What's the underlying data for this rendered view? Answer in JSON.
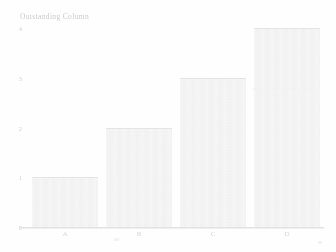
{
  "chart_data": {
    "type": "bar",
    "title": "Outstanding Column",
    "xlabel": "",
    "ylabel": "",
    "categories": [
      "A",
      "B",
      "C",
      "D"
    ],
    "values": [
      1,
      2,
      3,
      4
    ],
    "series": [
      {
        "name": "Series 1",
        "values": [
          1,
          2,
          3,
          4
        ]
      }
    ],
    "ylim": [
      0,
      4
    ],
    "yticks": [
      0,
      1,
      2,
      3,
      4
    ],
    "ytick_labels": [
      "0",
      "1",
      "2",
      "3",
      "4"
    ],
    "grid": false,
    "legend": false,
    "legend_position": "none",
    "bar_color": "#ededed",
    "axis_color": "#e2e2e2",
    "text_color": "#d2d2d2"
  }
}
